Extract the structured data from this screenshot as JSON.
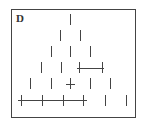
{
  "panel": {
    "label": "D",
    "frame": {
      "x": 11,
      "y": 9,
      "width": 124,
      "height": 108,
      "stroke": "#444444"
    }
  },
  "diagram": {
    "stroke": "#444444",
    "tick_half_height": 5,
    "rows": [
      {
        "y": 19,
        "ticks": [
          70
        ]
      },
      {
        "y": 35,
        "ticks": [
          60,
          80
        ]
      },
      {
        "y": 51,
        "ticks": [
          51,
          70,
          90
        ]
      },
      {
        "y": 67,
        "ticks": [
          41,
          61,
          79,
          102
        ]
      },
      {
        "y": 83,
        "ticks": [
          30,
          51,
          70,
          90,
          110
        ]
      },
      {
        "y": 100,
        "ticks": [
          21,
          42,
          63,
          83,
          105,
          126
        ]
      }
    ],
    "connectors": [
      {
        "row": 3,
        "x1": 77,
        "x2": 104,
        "y": 68
      },
      {
        "row": 4,
        "x1": 66,
        "x2": 75,
        "y": 84
      },
      {
        "row": 5,
        "x1": 18,
        "x2": 87,
        "y": 100
      }
    ]
  }
}
